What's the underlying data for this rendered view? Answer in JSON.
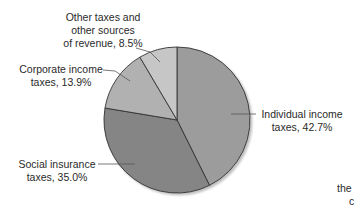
{
  "chart_data": {
    "type": "pie",
    "title": "",
    "start_angle_deg": 0,
    "direction": "clockwise",
    "slices": [
      {
        "label": "Individual income taxes",
        "value": 42.7,
        "color": "#9c9c9c",
        "label_lines": [
          "Individual income",
          "taxes, 42.7%"
        ]
      },
      {
        "label": "Social insurance taxes",
        "value": 35.0,
        "color": "#858585",
        "label_lines": [
          "Social insurance",
          "taxes, 35.0%"
        ]
      },
      {
        "label": "Corporate income taxes",
        "value": 13.9,
        "color": "#b1b1b1",
        "label_lines": [
          "Corporate income",
          "taxes, 13.9%"
        ]
      },
      {
        "label": "Other taxes and other sources of revenue",
        "value": 8.5,
        "color": "#c6c6c6",
        "label_lines": [
          "Other taxes and",
          "other sources",
          "of revenue, 8.5%"
        ]
      }
    ],
    "unit": "%"
  },
  "labels": {
    "individual": {
      "line1": "Individual income",
      "line2": "taxes, 42.7%"
    },
    "social": {
      "line1": "Social insurance",
      "line2": "taxes, 35.0%"
    },
    "corporate": {
      "line1": "Corporate income",
      "line2": "taxes, 13.9%"
    },
    "other": {
      "line1": "Other taxes and",
      "line2": "other sources",
      "line3": "of revenue, 8.5%"
    }
  },
  "cropped_text": {
    "line1": "the",
    "line2": "c"
  }
}
